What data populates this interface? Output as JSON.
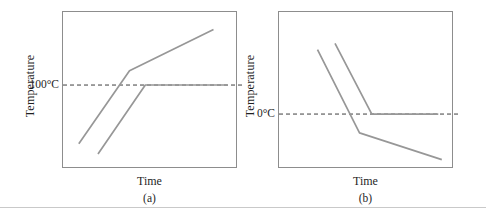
{
  "figure": {
    "background_color": "#ffffff",
    "series_line_color": "#979797",
    "plot_border_color": "#8d8d8d",
    "reference_line_color": "#3f3f3f",
    "text_color": "#1f1f1f"
  },
  "chart_data": [
    {
      "id": "a",
      "type": "line",
      "caption": "(a)",
      "xlabel": "Time",
      "ylabel": "Temperature",
      "axis": {
        "x_range": [
          0,
          10
        ],
        "y_range": [
          0,
          187
        ],
        "x_ticks": [],
        "y_ticks": [],
        "grid": false
      },
      "reference_line": {
        "label": "100°C",
        "value": 100,
        "style": "dashed",
        "overhang_px": 6
      },
      "series": [
        {
          "name": "heating-curve-rising-through-100",
          "points": [
            [
              0.9,
              30
            ],
            [
              3.8,
              117
            ],
            [
              8.6,
              166
            ]
          ]
        },
        {
          "name": "heating-curve-plateau-at-100",
          "points": [
            [
              2.0,
              18
            ],
            [
              4.7,
              100
            ],
            [
              9.4,
              100
            ]
          ]
        }
      ]
    },
    {
      "id": "b",
      "type": "line",
      "caption": "(b)",
      "xlabel": "Time",
      "ylabel": "Temperature",
      "axis": {
        "x_range": [
          0,
          10
        ],
        "y_range": [
          -35,
          65
        ],
        "x_ticks": [],
        "y_ticks": [],
        "grid": false
      },
      "reference_line": {
        "label": "0°C",
        "value": 0,
        "style": "dashed",
        "overhang_px": 6
      },
      "series": [
        {
          "name": "cooling-curve-falling-through-0",
          "points": [
            [
              2.2,
              41
            ],
            [
              4.6,
              -12
            ],
            [
              9.3,
              -29
            ]
          ]
        },
        {
          "name": "cooling-curve-plateau-at-0",
          "points": [
            [
              3.2,
              45
            ],
            [
              5.3,
              0
            ],
            [
              9.1,
              0
            ]
          ]
        }
      ]
    }
  ]
}
